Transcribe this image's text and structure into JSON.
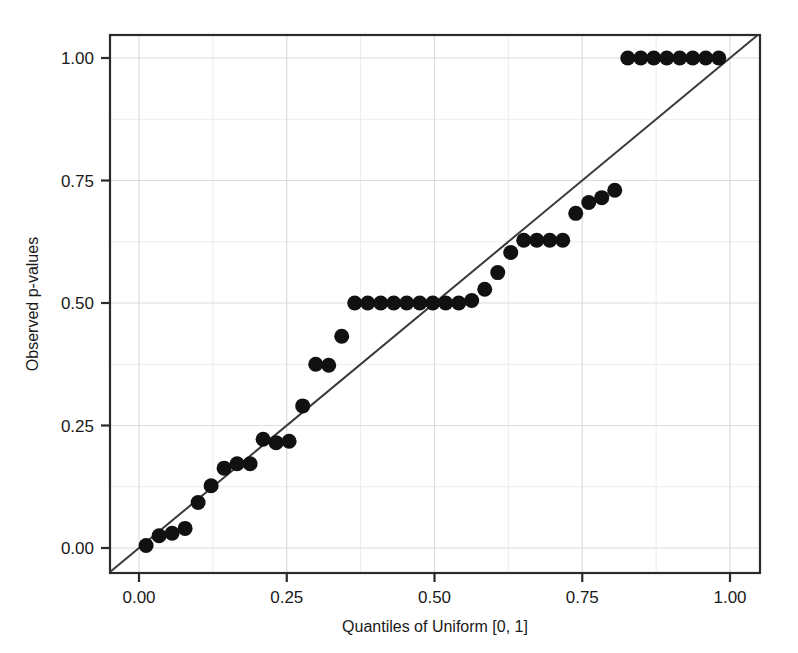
{
  "chart_data": {
    "type": "scatter",
    "title": "",
    "subtitle": "",
    "xlabel": "Quantiles of Uniform [0, 1]",
    "ylabel": "Observed p-values",
    "xlim": [
      -0.04,
      1.05
    ],
    "ylim": [
      -0.05,
      1.06
    ],
    "xticks": [
      0.0,
      0.25,
      0.5,
      0.75,
      1.0
    ],
    "xticklabels": [
      "0.00",
      "0.25",
      "0.50",
      "0.75",
      "1.00"
    ],
    "yticks": [
      0.0,
      0.25,
      0.5,
      0.75,
      1.0
    ],
    "yticklabels": [
      "0.00",
      "0.25",
      "0.50",
      "0.75",
      "1.00"
    ],
    "grid": true,
    "grid_minor": true,
    "legend": "none",
    "marker": "filled-circle",
    "marker_color": "#111111",
    "marker_size_px": 15,
    "reference_line": {
      "type": "identity",
      "label": "y = x",
      "color": "#3a3a3a",
      "width_px": 2,
      "x": [
        -0.04,
        1.05
      ],
      "y": [
        -0.04,
        1.05
      ]
    },
    "series": [
      {
        "name": "Observed p-values",
        "x": [
          0.012,
          0.034,
          0.056,
          0.078,
          0.1,
          0.122,
          0.144,
          0.166,
          0.188,
          0.21,
          0.232,
          0.254,
          0.277,
          0.299,
          0.321,
          0.343,
          0.365,
          0.387,
          0.409,
          0.431,
          0.453,
          0.475,
          0.497,
          0.519,
          0.541,
          0.563,
          0.585,
          0.607,
          0.629,
          0.651,
          0.673,
          0.695,
          0.717,
          0.739,
          0.761,
          0.783,
          0.805,
          0.827,
          0.849,
          0.871,
          0.893,
          0.915,
          0.937,
          0.959,
          0.981
        ],
        "y": [
          0.005,
          0.025,
          0.03,
          0.04,
          0.093,
          0.127,
          0.163,
          0.172,
          0.172,
          0.222,
          0.215,
          0.218,
          0.29,
          0.375,
          0.373,
          0.432,
          0.5,
          0.5,
          0.5,
          0.5,
          0.5,
          0.5,
          0.5,
          0.5,
          0.5,
          0.505,
          0.528,
          0.562,
          0.603,
          0.628,
          0.628,
          0.628,
          0.628,
          0.683,
          0.705,
          0.715,
          0.73,
          1.0,
          1.0,
          1.0,
          1.0,
          1.0,
          1.0,
          1.0,
          1.0
        ]
      }
    ]
  },
  "axes": {
    "x_title": "Quantiles of Uniform [0, 1]",
    "y_title": "Observed p-values",
    "x_tick_labels": [
      "0.00",
      "0.25",
      "0.50",
      "0.75",
      "1.00"
    ],
    "y_tick_labels": [
      "0.00",
      "0.25",
      "0.50",
      "0.75",
      "1.00"
    ]
  },
  "style": {
    "background": "#ffffff",
    "frame_color": "#2b2b2b",
    "grid_color": "#dcdcdc",
    "grid_minor_color": "#ececec",
    "point_color": "#111111",
    "line_color": "#3a3a3a",
    "text_color": "#1a1a1a"
  }
}
